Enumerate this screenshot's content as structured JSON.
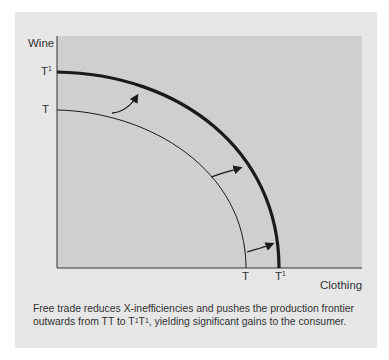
{
  "diagram": {
    "y_axis_label": "Wine",
    "x_axis_label": "Clothing",
    "y_ticks": [
      {
        "base": "T",
        "sup": "1"
      },
      {
        "base": "T",
        "sup": ""
      }
    ],
    "x_ticks": [
      {
        "base": "T",
        "sup": ""
      },
      {
        "base": "T",
        "sup": "1"
      }
    ],
    "curves": [
      {
        "name": "TT",
        "description": "original production frontier",
        "stroke": "thin"
      },
      {
        "name": "T1T1",
        "description": "new production frontier after free trade",
        "stroke": "thick"
      }
    ],
    "arrows": 3,
    "colors": {
      "outer_panel": "#e6e6e6",
      "plot_area": "#cfcfcf",
      "curve": "#1a1a1a"
    }
  },
  "caption": {
    "line1": "Free trade reduces X-inefficiencies and pushes the production frontier",
    "line2_pre": "outwards from TT to T",
    "sup1": "1",
    "mid": "T",
    "sup2": "1",
    "line2_post": ",  yielding significant gains to the consumer."
  }
}
